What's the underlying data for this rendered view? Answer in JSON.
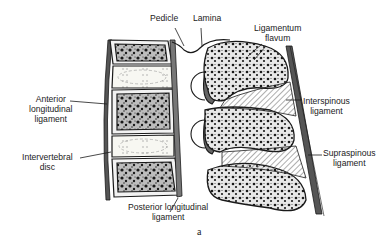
{
  "figure": {
    "caption": "a",
    "labels": {
      "pedicle": [
        "Pedicle"
      ],
      "lamina": [
        "Lamina"
      ],
      "ligamentum_flavum": [
        "Ligamentum",
        "flavum"
      ],
      "anterior_longitudinal_ligament": [
        "Anterior",
        "longitudinal",
        "ligament"
      ],
      "interspinous_ligament": [
        "Interspinous",
        "ligament"
      ],
      "intervertebral_disc": [
        "Intervertebral",
        "disc"
      ],
      "supraspinous_ligament": [
        "Supraspinous",
        "ligament"
      ],
      "posterior_longitudinal_ligament": [
        "Posterior longitudinal",
        "ligament"
      ]
    },
    "colors": {
      "ink": "#1a1a1a",
      "bone_fill": "#3a3a3a",
      "disc_fill": "#f7f7f2",
      "background": "#ffffff"
    }
  }
}
